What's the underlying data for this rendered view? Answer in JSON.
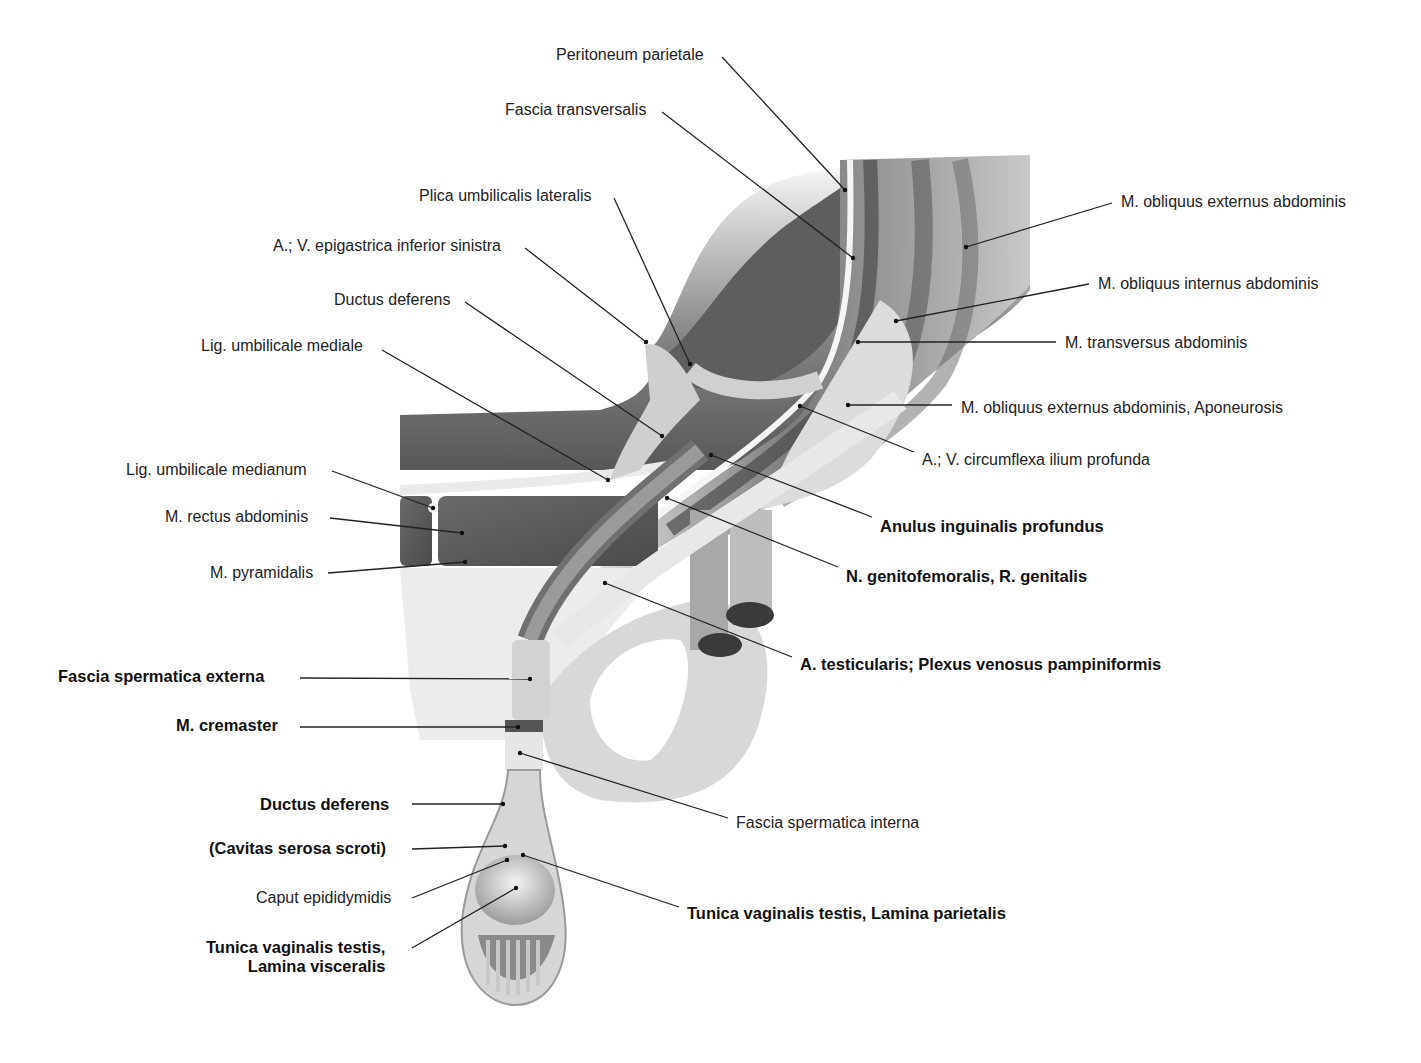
{
  "figure": {
    "type": "anatomical-illustration",
    "colors": {
      "background": "#ffffff",
      "leader_line": "#222222",
      "tissue_light": "#e4e4e4",
      "tissue_mid": "#b5b5b5",
      "tissue_dark": "#5a5a5a"
    }
  },
  "labels": [
    {
      "id": "peritoneum-parietale",
      "text": "Peritoneum parietale",
      "bold": false,
      "x": 556,
      "y": 45,
      "align": "left",
      "line": [
        [
          722,
          57
        ],
        [
          845,
          190
        ]
      ]
    },
    {
      "id": "fascia-transversalis",
      "text": "Fascia transversalis",
      "bold": false,
      "x": 505,
      "y": 100,
      "align": "left",
      "line": [
        [
          662,
          112
        ],
        [
          853,
          258
        ]
      ]
    },
    {
      "id": "plica-umbilicalis-lateralis",
      "text": "Plica umbilicalis lateralis",
      "bold": false,
      "x": 419,
      "y": 186,
      "align": "left",
      "line": [
        [
          614,
          198
        ],
        [
          690,
          364
        ]
      ]
    },
    {
      "id": "a-v-epigastrica-inferior-sinistra",
      "text": "A.; V. epigastrica inferior sinistra",
      "bold": false,
      "x": 273,
      "y": 236,
      "align": "left",
      "line": [
        [
          525,
          248
        ],
        [
          646,
          342
        ]
      ]
    },
    {
      "id": "ductus-deferens-upper",
      "text": "Ductus deferens",
      "bold": false,
      "x": 334,
      "y": 290,
      "align": "left",
      "line": [
        [
          465,
          302
        ],
        [
          662,
          436
        ]
      ]
    },
    {
      "id": "lig-umbilicale-mediale",
      "text": "Lig. umbilicale mediale",
      "bold": false,
      "x": 201,
      "y": 336,
      "align": "left",
      "line": [
        [
          382,
          350
        ],
        [
          608,
          480
        ]
      ]
    },
    {
      "id": "lig-umbilicale-medianum",
      "text": "Lig. umbilicale medianum",
      "bold": false,
      "x": 126,
      "y": 460,
      "align": "left",
      "line": [
        [
          332,
          471
        ],
        [
          433,
          508
        ]
      ]
    },
    {
      "id": "m-rectus-abdominis",
      "text": "M. rectus abdominis",
      "bold": false,
      "x": 165,
      "y": 507,
      "align": "left",
      "line": [
        [
          330,
          518
        ],
        [
          462,
          533
        ]
      ]
    },
    {
      "id": "m-pyramidalis",
      "text": "M. pyramidalis",
      "bold": false,
      "x": 210,
      "y": 563,
      "align": "left",
      "line": [
        [
          328,
          573
        ],
        [
          465,
          562
        ]
      ]
    },
    {
      "id": "fascia-spermatica-externa",
      "text": "Fascia spermatica externa",
      "bold": true,
      "x": 58,
      "y": 667,
      "align": "left",
      "line": [
        [
          300,
          678
        ],
        [
          530,
          679
        ]
      ]
    },
    {
      "id": "m-cremaster",
      "text": "M. cremaster",
      "bold": true,
      "x": 176,
      "y": 716,
      "align": "left",
      "line": [
        [
          300,
          727
        ],
        [
          518,
          727
        ]
      ]
    },
    {
      "id": "ductus-deferens-lower",
      "text": "Ductus deferens",
      "bold": true,
      "x": 260,
      "y": 795,
      "align": "left",
      "line": [
        [
          412,
          804
        ],
        [
          503,
          804
        ]
      ]
    },
    {
      "id": "cavitas-serosa-scroti",
      "text": "(Cavitas serosa scroti)",
      "bold": true,
      "x": 209,
      "y": 839,
      "align": "left",
      "line": [
        [
          412,
          849
        ],
        [
          505,
          846
        ]
      ]
    },
    {
      "id": "caput-epididymidis",
      "text": "Caput epididymidis",
      "bold": false,
      "x": 256,
      "y": 888,
      "align": "left",
      "line": [
        [
          412,
          898
        ],
        [
          507,
          860
        ]
      ]
    },
    {
      "id": "tunica-vaginalis-lamina-visceralis",
      "text": "Tunica vaginalis testis,\nLamina visceralis",
      "bold": true,
      "x": 206,
      "y": 938,
      "align": "right",
      "line": [
        [
          412,
          948
        ],
        [
          516,
          888
        ]
      ]
    },
    {
      "id": "m-obliquus-externus-abdominis",
      "text": "M. obliquus externus abdominis",
      "bold": false,
      "x": 1121,
      "y": 192,
      "align": "left",
      "line": [
        [
          1112,
          203
        ],
        [
          966,
          247
        ]
      ]
    },
    {
      "id": "m-obliquus-internus-abdominis",
      "text": "M. obliquus internus abdominis",
      "bold": false,
      "x": 1098,
      "y": 274,
      "align": "left",
      "line": [
        [
          1089,
          284
        ],
        [
          896,
          321
        ]
      ]
    },
    {
      "id": "m-transversus-abdominis",
      "text": "M. transversus abdominis",
      "bold": false,
      "x": 1065,
      "y": 333,
      "align": "left",
      "line": [
        [
          1056,
          342
        ],
        [
          858,
          342
        ]
      ]
    },
    {
      "id": "m-obliquus-externus-aponeurosis",
      "text": "M. obliquus externus abdominis, Aponeurosis",
      "bold": false,
      "x": 961,
      "y": 398,
      "align": "left",
      "line": [
        [
          952,
          405
        ],
        [
          848,
          405
        ]
      ]
    },
    {
      "id": "a-v-circumflexa-ilium-profunda",
      "text": "A.; V. circumflexa ilium profunda",
      "bold": false,
      "x": 922,
      "y": 450,
      "align": "left",
      "line": [
        [
          914,
          452
        ],
        [
          800,
          406
        ]
      ]
    },
    {
      "id": "anulus-inguinalis-profundus",
      "text": "Anulus inguinalis profundus",
      "bold": true,
      "x": 880,
      "y": 517,
      "align": "left",
      "line": [
        [
          872,
          517
        ],
        [
          711,
          455
        ]
      ]
    },
    {
      "id": "n-genitofemoralis-r-genitalis",
      "text": "N. genitofemoralis, R. genitalis",
      "bold": true,
      "x": 846,
      "y": 567,
      "align": "left",
      "line": [
        [
          838,
          567
        ],
        [
          667,
          498
        ]
      ]
    },
    {
      "id": "a-testicularis-plexus-pampiniformis",
      "text": "A. testicularis; Plexus venosus pampiniformis",
      "bold": true,
      "x": 800,
      "y": 655,
      "align": "left",
      "line": [
        [
          792,
          657
        ],
        [
          605,
          583
        ]
      ]
    },
    {
      "id": "fascia-spermatica-interna",
      "text": "Fascia spermatica interna",
      "bold": false,
      "x": 736,
      "y": 813,
      "align": "left",
      "line": [
        [
          728,
          818
        ],
        [
          520,
          753
        ]
      ]
    },
    {
      "id": "tunica-vaginalis-lamina-parietalis",
      "text": "Tunica vaginalis testis, Lamina parietalis",
      "bold": true,
      "x": 687,
      "y": 904,
      "align": "left",
      "line": [
        [
          679,
          907
        ],
        [
          523,
          855
        ]
      ]
    }
  ]
}
